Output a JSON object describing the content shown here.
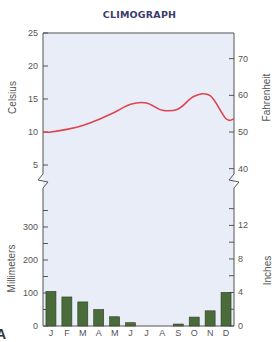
{
  "chart_data": [
    {
      "type": "line",
      "title": "CLIMOGRAPH",
      "xlabel": "",
      "ylabel": "Celsius",
      "ylabel_right": "Fahrenheit",
      "categories": [
        "J",
        "F",
        "M",
        "A",
        "M",
        "J",
        "J",
        "A",
        "S",
        "O",
        "N",
        "D"
      ],
      "series": [
        {
          "name": "Temperature (°C)",
          "values": [
            10.0,
            10.4,
            11.0,
            11.9,
            13.0,
            14.2,
            14.4,
            13.3,
            13.5,
            15.4,
            15.5,
            12.0
          ],
          "color": "#e0434e"
        }
      ],
      "ylim": [
        2,
        25
      ],
      "yticks_left": [
        5,
        10,
        15,
        20,
        25
      ],
      "yticks_right": [
        40,
        50,
        60,
        70
      ],
      "axis_break": true,
      "grid": false
    },
    {
      "type": "bar",
      "xlabel": "",
      "ylabel": "Millimeters",
      "ylabel_right": "Inches",
      "categories": [
        "J",
        "F",
        "M",
        "A",
        "M",
        "J",
        "J",
        "A",
        "S",
        "O",
        "N",
        "D"
      ],
      "series": [
        {
          "name": "Precipitation (mm)",
          "values": [
            105,
            88,
            73,
            50,
            28,
            10,
            0,
            0,
            6,
            27,
            46,
            102
          ],
          "color": "#4a6b3a"
        }
      ],
      "ylim": [
        0,
        350
      ],
      "yticks_left": [
        0,
        100,
        200,
        300
      ],
      "yticks_right": [
        0,
        4,
        8,
        12
      ],
      "grid": false
    }
  ],
  "chart": {
    "title": "CLIMOGRAPH",
    "celsius_label": "Celsius",
    "fahrenheit_label": "Fahrenheit",
    "mm_label": "Millimeters",
    "inches_label": "Inches",
    "celsius_ticks": [
      "25",
      "20",
      "15",
      "10",
      "5"
    ],
    "fahrenheit_ticks": [
      "70",
      "60",
      "50",
      "40"
    ],
    "mm_ticks": [
      "300",
      "200",
      "100",
      "0"
    ],
    "inch_ticks": [
      "12",
      "8",
      "4",
      "0"
    ],
    "months": [
      "J",
      "F",
      "M",
      "A",
      "M",
      "J",
      "J",
      "A",
      "S",
      "O",
      "N",
      "D"
    ],
    "corner_glyph": "A",
    "colors": {
      "line": "#e0434e",
      "bar": "#4a6b3a",
      "plot_bg": "#e9edf8",
      "axis": "#555555",
      "title": "#3b3a6b"
    }
  }
}
